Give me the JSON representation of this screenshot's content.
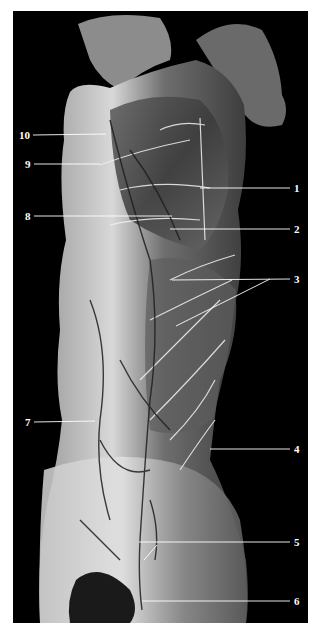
{
  "figure": {
    "background": "#000000",
    "labels": [
      {
        "id": "10",
        "text": "10",
        "x": 18,
        "y": 129,
        "side": "left"
      },
      {
        "id": "9",
        "text": "9",
        "x": 24,
        "y": 158,
        "side": "left"
      },
      {
        "id": "1",
        "text": "1",
        "x": 295,
        "y": 182,
        "side": "right"
      },
      {
        "id": "8",
        "text": "8",
        "x": 24,
        "y": 210,
        "side": "left"
      },
      {
        "id": "2",
        "text": "2",
        "x": 295,
        "y": 223,
        "side": "right"
      },
      {
        "id": "3",
        "text": "3",
        "x": 295,
        "y": 273,
        "side": "right"
      },
      {
        "id": "7",
        "text": "7",
        "x": 24,
        "y": 416,
        "side": "left"
      },
      {
        "id": "4",
        "text": "4",
        "x": 295,
        "y": 443,
        "side": "right"
      },
      {
        "id": "5",
        "text": "5",
        "x": 295,
        "y": 536,
        "side": "right"
      },
      {
        "id": "6",
        "text": "6",
        "x": 295,
        "y": 595,
        "side": "right"
      }
    ]
  }
}
